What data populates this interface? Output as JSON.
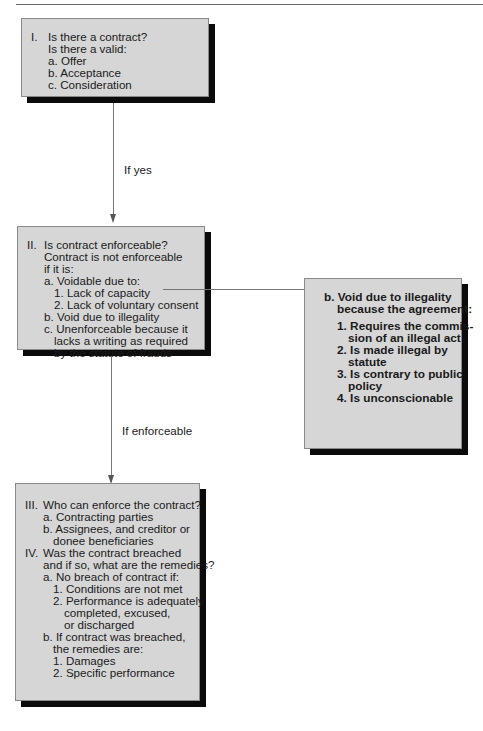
{
  "header": {
    "text": "...ing ...y"
  },
  "boxes": {
    "contract": {
      "num": "I.",
      "lines": [
        "Is there a contract?",
        "Is there a valid:",
        "a. Offer",
        "b. Acceptance",
        "c. Consideration"
      ]
    },
    "enforceable": {
      "num": "II.",
      "lines": [
        "Is contract enforceable?",
        "Contract is not enforceable",
        "if it is:",
        "a. Voidable due to:",
        "1. Lack of capacity",
        "2. Lack of voluntary consent",
        "b. Void due to illegality",
        "c. Unenforceable because it",
        "lacks a writing as required",
        "by the statute of frauds"
      ]
    },
    "illegality": {
      "lines": [
        "b. Void due to illegality",
        "because the agreement:",
        "1. Requires the commis-",
        "sion of an illegal act",
        "2. Is made illegal by",
        "statute",
        "3. Is contrary to public",
        "policy",
        "4. Is unconscionable"
      ]
    },
    "remedies": {
      "num3": "III.",
      "num4": "IV.",
      "lines": [
        "Who can enforce the contract?",
        "a. Contracting parties",
        "b. Assignees, and creditor or",
        "donee beneficiaries",
        "Was the contract breached",
        "and if so, what are the remedies?",
        "a. No breach of contract if:",
        "1. Conditions are not met",
        "2. Performance is adequately",
        "completed, excused,",
        "or discharged",
        "b. If contract was breached,",
        "the remedies are:",
        "1. Damages",
        "2. Specific performance"
      ]
    }
  },
  "connectors": {
    "if_yes": "If yes",
    "if_enforceable": "If enforceable"
  },
  "colors": {
    "box_fill": "#d6d6d6",
    "shadow": "#0b0b0b",
    "line": "#777777"
  }
}
